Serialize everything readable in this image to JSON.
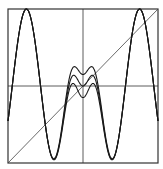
{
  "chart_data": {
    "type": "line",
    "title": "",
    "xlabel": "",
    "ylabel": "",
    "xlim": [
      -1,
      1
    ],
    "ylim": [
      -1,
      1
    ],
    "grid": false,
    "axes_crosshair": true,
    "legend": [],
    "series": [
      {
        "name": "curve-a",
        "description": "W-shaped map, center minimum highest",
        "center_value": 0.15
      },
      {
        "name": "curve-b",
        "description": "W-shaped map, center minimum middle",
        "center_value": 0.0
      },
      {
        "name": "curve-c",
        "description": "W-shaped map, center minimum lowest",
        "center_value": -0.15
      },
      {
        "name": "diagonal",
        "description": "identity line y = x",
        "x": [
          -1,
          1
        ],
        "y": [
          -1,
          1
        ]
      }
    ],
    "features": {
      "peaks_x": [
        -0.36,
        0.38
      ],
      "peak_y": 1.0,
      "side_minima_x": [
        -0.76,
        0.75
      ],
      "side_minima_y": -0.95
    }
  },
  "colors": {
    "ink": "#1a1a1a",
    "frame": "#333333",
    "background": "#ffffff"
  }
}
